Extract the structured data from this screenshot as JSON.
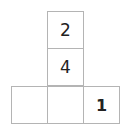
{
  "net": {
    "cells": [
      {
        "row": 0,
        "col": 1,
        "value": "2"
      },
      {
        "row": 1,
        "col": 1,
        "value": "4"
      },
      {
        "row": 2,
        "col": 0,
        "value": ""
      },
      {
        "row": 2,
        "col": 1,
        "value": ""
      },
      {
        "row": 2,
        "col": 2,
        "value": "1"
      }
    ]
  }
}
